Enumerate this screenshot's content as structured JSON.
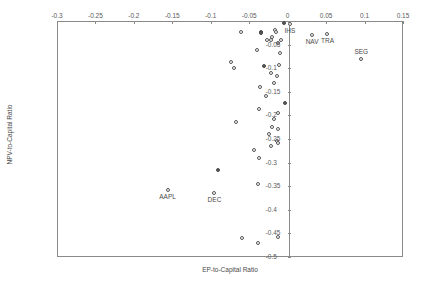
{
  "chart_data": {
    "type": "scatter",
    "title": "",
    "xlabel": "EP-to-Capital Ratio",
    "ylabel": "NPV-to-Capital Ratio",
    "xlim": [
      -0.3,
      0.15
    ],
    "ylim": [
      -0.5,
      0.0
    ],
    "grid": false,
    "legend": "none",
    "xticks": [
      -0.3,
      -0.25,
      -0.2,
      -0.15,
      -0.1,
      -0.05,
      0,
      0.05,
      0.1,
      0.15
    ],
    "xtick_labels": [
      "-0.3",
      "-0.25",
      "-0.2",
      "-0.15",
      "-0.1",
      "-0.05",
      "0",
      "0.05",
      "0.1",
      "0.15"
    ],
    "yticks": [
      0,
      -0.05,
      -0.1,
      -0.15,
      -0.2,
      -0.25,
      -0.3,
      -0.35,
      -0.4,
      -0.45,
      -0.5
    ],
    "ytick_labels": [
      "0",
      "-0.05",
      "-0.1",
      "-0.15",
      "-0.2",
      "-0.25",
      "-0.3",
      "-0.35",
      "-0.4",
      "-0.45",
      "-0.5"
    ],
    "zero_reference_line_x": 0,
    "points": [
      {
        "x": -0.0055,
        "y": -0.0025,
        "label": "",
        "filled": true
      },
      {
        "x": -0.0175,
        "y": -0.0175,
        "label": "",
        "filled": false
      },
      {
        "x": -0.0165,
        "y": -0.0215,
        "label": "",
        "filled": false
      },
      {
        "x": -0.0355,
        "y": -0.0215,
        "label": "",
        "filled": true
      },
      {
        "x": -0.0365,
        "y": -0.0235,
        "label": "",
        "filled": true
      },
      {
        "x": -0.0615,
        "y": -0.0205,
        "label": "",
        "filled": false
      },
      {
        "x": -0.0215,
        "y": -0.0325,
        "label": "",
        "filled": false
      },
      {
        "x": -0.0235,
        "y": -0.0375,
        "label": "",
        "filled": false
      },
      {
        "x": -0.0285,
        "y": -0.0385,
        "label": "",
        "filled": false
      },
      {
        "x": -0.0095,
        "y": -0.0385,
        "label": "",
        "filled": false
      },
      {
        "x": -0.0135,
        "y": -0.0455,
        "label": "",
        "filled": false
      },
      {
        "x": 0.0015,
        "y": -0.0045,
        "label": "IHS",
        "filled": false,
        "label_pos": "below"
      },
      {
        "x": 0.0305,
        "y": -0.0265,
        "label": "NAV",
        "filled": false,
        "label_pos": "below"
      },
      {
        "x": 0.0505,
        "y": -0.0255,
        "label": "TRA",
        "filled": false,
        "label_pos": "below"
      },
      {
        "x": 0.0945,
        "y": -0.0785,
        "label": "SEG",
        "filled": false,
        "label_pos": "above"
      },
      {
        "x": -0.0415,
        "y": -0.0585,
        "label": "",
        "filled": false
      },
      {
        "x": -0.0115,
        "y": -0.0665,
        "label": "",
        "filled": false
      },
      {
        "x": -0.0755,
        "y": -0.0855,
        "label": "",
        "filled": false
      },
      {
        "x": -0.0125,
        "y": -0.0915,
        "label": "",
        "filled": false
      },
      {
        "x": -0.0325,
        "y": -0.0935,
        "label": "",
        "filled": true
      },
      {
        "x": -0.0705,
        "y": -0.0975,
        "label": "",
        "filled": false
      },
      {
        "x": -0.0235,
        "y": -0.1085,
        "label": "",
        "filled": false
      },
      {
        "x": -0.0155,
        "y": -0.1135,
        "label": "",
        "filled": false
      },
      {
        "x": -0.0195,
        "y": -0.1295,
        "label": "",
        "filled": false
      },
      {
        "x": -0.0375,
        "y": -0.1385,
        "label": "",
        "filled": false
      },
      {
        "x": -0.0295,
        "y": -0.1565,
        "label": "",
        "filled": false
      },
      {
        "x": -0.0045,
        "y": -0.1715,
        "label": "",
        "filled": true
      },
      {
        "x": -0.0385,
        "y": -0.1845,
        "label": "",
        "filled": false
      },
      {
        "x": -0.0135,
        "y": -0.1935,
        "label": "",
        "filled": false
      },
      {
        "x": -0.0185,
        "y": -0.2055,
        "label": "",
        "filled": false
      },
      {
        "x": -0.0685,
        "y": -0.2125,
        "label": "",
        "filled": false
      },
      {
        "x": -0.0215,
        "y": -0.2235,
        "label": "",
        "filled": false
      },
      {
        "x": -0.0135,
        "y": -0.2265,
        "label": "",
        "filled": false
      },
      {
        "x": -0.0255,
        "y": -0.2375,
        "label": "",
        "filled": false
      },
      {
        "x": -0.0155,
        "y": -0.2525,
        "label": "",
        "filled": false
      },
      {
        "x": -0.0145,
        "y": -0.2565,
        "label": "",
        "filled": false
      },
      {
        "x": -0.0235,
        "y": -0.2625,
        "label": "",
        "filled": false
      },
      {
        "x": -0.0455,
        "y": -0.2715,
        "label": "",
        "filled": false
      },
      {
        "x": -0.0385,
        "y": -0.2885,
        "label": "",
        "filled": false
      },
      {
        "x": -0.0925,
        "y": -0.3135,
        "label": "",
        "filled": true
      },
      {
        "x": -0.1575,
        "y": -0.3565,
        "label": "AAPL",
        "filled": false,
        "label_pos": "below"
      },
      {
        "x": -0.0405,
        "y": -0.3435,
        "label": "",
        "filled": false
      },
      {
        "x": -0.0965,
        "y": -0.3625,
        "label": "DEC",
        "filled": false,
        "label_pos": "below"
      },
      {
        "x": -0.0605,
        "y": -0.4585,
        "label": "",
        "filled": false
      },
      {
        "x": -0.0395,
        "y": -0.4685,
        "label": "",
        "filled": false
      },
      {
        "x": -0.0145,
        "y": -0.4555,
        "label": "",
        "filled": false
      }
    ]
  }
}
